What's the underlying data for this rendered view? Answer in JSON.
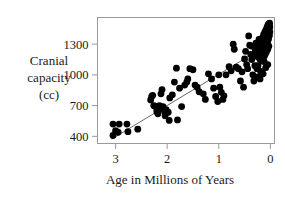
{
  "chart_data": {
    "type": "scatter",
    "title": "",
    "subtitle": "",
    "xlabel": "Age in Millions of Years",
    "ylabel": "Cranial capacity (cc)",
    "ylabel_lines": [
      "Cranial",
      "capacity",
      "(cc)"
    ],
    "xlim": [
      3.35,
      -0.08
    ],
    "ylim": [
      330,
      1560
    ],
    "x_reversed": true,
    "xticks": [
      3,
      2,
      1,
      0
    ],
    "xticklabels": [
      "3",
      "2",
      "1",
      "0"
    ],
    "yticks": [
      1300,
      1000,
      700,
      400
    ],
    "yticklabels": [
      "1300",
      "1000",
      "700",
      "400"
    ],
    "grid": false,
    "legend": "none",
    "marker_color": "#000000",
    "marker_size": 3.4,
    "frame_color": "#9a9a9a",
    "trendline": {
      "type": "linear",
      "color": "#555555",
      "x_start": 3.07,
      "y_start": 375,
      "x_end": 0.31,
      "y_end": 1215
    },
    "points": [
      [
        3.05,
        408
      ],
      [
        3.05,
        520
      ],
      [
        2.93,
        520
      ],
      [
        3.0,
        455
      ],
      [
        2.95,
        440
      ],
      [
        2.78,
        520
      ],
      [
        2.76,
        445
      ],
      [
        2.57,
        470
      ],
      [
        2.32,
        755
      ],
      [
        2.3,
        790
      ],
      [
        2.28,
        800
      ],
      [
        2.26,
        700
      ],
      [
        2.24,
        695
      ],
      [
        2.22,
        690
      ],
      [
        2.2,
        670
      ],
      [
        2.2,
        640
      ],
      [
        2.18,
        645
      ],
      [
        2.18,
        620
      ],
      [
        2.16,
        660
      ],
      [
        2.15,
        700
      ],
      [
        2.12,
        815
      ],
      [
        2.1,
        855
      ],
      [
        2.08,
        690
      ],
      [
        2.05,
        640
      ],
      [
        2.04,
        600
      ],
      [
        2.02,
        660
      ],
      [
        1.98,
        635
      ],
      [
        1.96,
        555
      ],
      [
        1.95,
        775
      ],
      [
        1.9,
        805
      ],
      [
        1.86,
        930
      ],
      [
        1.82,
        1065
      ],
      [
        1.8,
        560
      ],
      [
        1.76,
        870
      ],
      [
        1.72,
        690
      ],
      [
        1.66,
        900
      ],
      [
        1.62,
        930
      ],
      [
        1.6,
        960
      ],
      [
        1.56,
        1060
      ],
      [
        1.5,
        1050
      ],
      [
        1.46,
        900
      ],
      [
        1.42,
        880
      ],
      [
        1.38,
        835
      ],
      [
        1.3,
        815
      ],
      [
        1.26,
        760
      ],
      [
        1.2,
        1010
      ],
      [
        1.14,
        960
      ],
      [
        1.1,
        870
      ],
      [
        1.06,
        790
      ],
      [
        1.02,
        740
      ],
      [
        1.0,
        1000
      ],
      [
        0.98,
        880
      ],
      [
        0.95,
        830
      ],
      [
        0.92,
        760
      ],
      [
        0.9,
        795
      ],
      [
        0.86,
        1000
      ],
      [
        0.8,
        1080
      ],
      [
        0.76,
        1040
      ],
      [
        0.72,
        1300
      ],
      [
        0.7,
        1250
      ],
      [
        0.66,
        1075
      ],
      [
        0.62,
        1060
      ],
      [
        0.58,
        940
      ],
      [
        0.55,
        1030
      ],
      [
        0.52,
        880
      ],
      [
        0.5,
        1155
      ],
      [
        0.48,
        1230
      ],
      [
        0.46,
        1100
      ],
      [
        0.44,
        1060
      ],
      [
        0.42,
        1380
      ],
      [
        0.4,
        1290
      ],
      [
        0.38,
        1200
      ],
      [
        0.36,
        1150
      ],
      [
        0.34,
        1000
      ],
      [
        0.32,
        940
      ],
      [
        0.3,
        1090
      ],
      [
        0.29,
        1240
      ],
      [
        0.28,
        1310
      ],
      [
        0.27,
        1190
      ],
      [
        0.26,
        1060
      ],
      [
        0.25,
        980
      ],
      [
        0.24,
        1175
      ],
      [
        0.23,
        1280
      ],
      [
        0.22,
        1345
      ],
      [
        0.21,
        1240
      ],
      [
        0.2,
        1150
      ],
      [
        0.19,
        1035
      ],
      [
        0.185,
        1240
      ],
      [
        0.18,
        1320
      ],
      [
        0.175,
        1290
      ],
      [
        0.17,
        1205
      ],
      [
        0.165,
        1135
      ],
      [
        0.16,
        1260
      ],
      [
        0.155,
        1360
      ],
      [
        0.15,
        1300
      ],
      [
        0.145,
        1230
      ],
      [
        0.14,
        1180
      ],
      [
        0.135,
        1290
      ],
      [
        0.13,
        1395
      ],
      [
        0.125,
        1335
      ],
      [
        0.12,
        1255
      ],
      [
        0.115,
        1185
      ],
      [
        0.11,
        1310
      ],
      [
        0.105,
        1420
      ],
      [
        0.1,
        1355
      ],
      [
        0.098,
        1275
      ],
      [
        0.095,
        1205
      ],
      [
        0.09,
        1330
      ],
      [
        0.085,
        1440
      ],
      [
        0.08,
        1375
      ],
      [
        0.078,
        1295
      ],
      [
        0.075,
        1225
      ],
      [
        0.07,
        1350
      ],
      [
        0.065,
        1465
      ],
      [
        0.06,
        1400
      ],
      [
        0.055,
        1320
      ],
      [
        0.05,
        1250
      ],
      [
        0.048,
        1380
      ],
      [
        0.045,
        1490
      ],
      [
        0.04,
        1430
      ],
      [
        0.035,
        1350
      ],
      [
        0.03,
        1280
      ],
      [
        0.028,
        1410
      ],
      [
        0.025,
        1500
      ],
      [
        0.02,
        1455
      ],
      [
        0.018,
        1385
      ],
      [
        0.015,
        1505
      ],
      [
        0.012,
        1470
      ],
      [
        0.01,
        1420
      ],
      [
        0.05,
        1100
      ],
      [
        0.09,
        1070
      ],
      [
        0.14,
        1010
      ],
      [
        0.2,
        960
      ],
      [
        0.24,
        1090
      ],
      [
        0.3,
        1210
      ],
      [
        0.36,
        1280
      ],
      [
        0.12,
        1130
      ]
    ]
  },
  "figure": {
    "background": "#ffffff"
  }
}
